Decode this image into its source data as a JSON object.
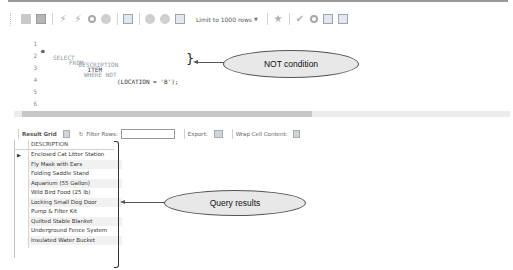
{
  "toolbar": {
    "icons": [
      "open-folder-icon",
      "save-icon",
      "execute-icon",
      "execute-current-icon",
      "explain-icon",
      "stop-icon",
      "toggle-results-icon",
      "commit-icon",
      "rollback-icon",
      "autocommit-icon"
    ],
    "limit_select": "Limit to 1000 rows",
    "right_icons": [
      "beautify-icon",
      "find-icon",
      "search-icon",
      "invisible-chars-icon",
      "wrap-icon"
    ]
  },
  "editor": {
    "lines": [
      {
        "num": "1",
        "marker": "●",
        "keyword": "SELECT",
        "rest": " DESCRIPTION"
      },
      {
        "num": "2",
        "marker": "",
        "keyword": "FROM",
        "rest": " ITEM"
      },
      {
        "num": "3",
        "marker": "",
        "keyword": "WHERE NOT",
        "rest": "(LOCATION = 'B');"
      },
      {
        "num": "4",
        "marker": "",
        "keyword": "",
        "rest": ""
      },
      {
        "num": "5",
        "marker": "",
        "keyword": "",
        "rest": ""
      },
      {
        "num": "6",
        "marker": "",
        "keyword": "",
        "rest": ""
      }
    ]
  },
  "results_toolbar": {
    "result_grid": "Result Grid",
    "filter_rows": "Filter Rows:",
    "filter_value": "",
    "export": "Export:",
    "wrap": "Wrap Cell Content:"
  },
  "grid": {
    "column": "DESCRIPTION",
    "rows": [
      "Enclosed Cat Litter Station",
      "Fly Mask with Ears",
      "Folding Saddle Stand",
      "Aquarium (55 Gallon)",
      "Wild Bird Food (25 lb)",
      "Locking Small Dog Door",
      "Pump & Filter Kit",
      "Quilted Stable Blanket",
      "Underground Fence System",
      "Insulated Water Bucket"
    ]
  },
  "annotations": {
    "not_condition": "NOT condition",
    "query_results": "Query results"
  }
}
